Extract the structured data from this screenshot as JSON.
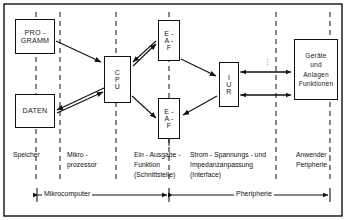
{
  "diagram": {
    "title_hidden": "",
    "frame": {
      "border_color": "#111111",
      "background": "#ffffff"
    },
    "nodes": {
      "programm": {
        "lines": [
          "PRO -",
          "GRAMM"
        ]
      },
      "daten": {
        "lines": [
          "DATEN"
        ]
      },
      "cpu": {
        "lines": [
          "C",
          "P",
          "U"
        ]
      },
      "eaf_top": {
        "lines": [
          "E -",
          "A -",
          "F"
        ]
      },
      "eaf_bottom": {
        "lines": [
          "E -",
          "A -",
          "F"
        ]
      },
      "iur": {
        "lines": [
          "I",
          "U",
          "R"
        ]
      },
      "geraete": {
        "lines": [
          "Geräte",
          "und",
          "Anlagen",
          "Funktionen"
        ]
      }
    },
    "column_captions": {
      "speicher": "Speicher",
      "mikroprozessor": "Mikro -\nprozessor",
      "ein_ausgabe": "Ein - Ausgabe -\nFunktion\n(Schnittstelle)",
      "interface": "Strom - Spannungs - und\nImpedanzanpassung\n(Interface)",
      "anwender": "Anwender -\nPeripherie"
    },
    "brackets": {
      "mikrocomputer": "Mikrocomputer",
      "peripherie": "Pheripherie"
    },
    "vertical_dots": "⋮"
  }
}
